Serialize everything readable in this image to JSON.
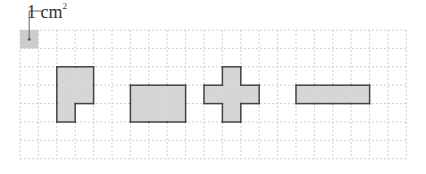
{
  "diagram": {
    "unit_label": "1 cm",
    "unit_superscript": "2",
    "grid": {
      "cols": 21,
      "rows": 7,
      "cell_size_px": 18.4,
      "origin_x": 20,
      "origin_y": 30,
      "line_color": "#cfcfcf"
    },
    "unit_square": {
      "col": 0,
      "row": 0,
      "fill": "#cccccc"
    },
    "shape_fill": "#d6d6d6",
    "shape_stroke": "#444444",
    "shapes": [
      {
        "name": "l-shape",
        "cells": [
          [
            2,
            2
          ],
          [
            3,
            2
          ],
          [
            2,
            3
          ],
          [
            3,
            3
          ],
          [
            2,
            4
          ]
        ]
      },
      {
        "name": "rectangle",
        "cells": [
          [
            6,
            3
          ],
          [
            7,
            3
          ],
          [
            8,
            3
          ],
          [
            6,
            4
          ],
          [
            7,
            4
          ],
          [
            8,
            4
          ]
        ]
      },
      {
        "name": "cross",
        "cells": [
          [
            11,
            2
          ],
          [
            10,
            3
          ],
          [
            11,
            3
          ],
          [
            12,
            3
          ],
          [
            11,
            4
          ]
        ]
      },
      {
        "name": "bar",
        "cells": [
          [
            15,
            3
          ],
          [
            16,
            3
          ],
          [
            17,
            3
          ],
          [
            18,
            3
          ]
        ]
      }
    ]
  }
}
